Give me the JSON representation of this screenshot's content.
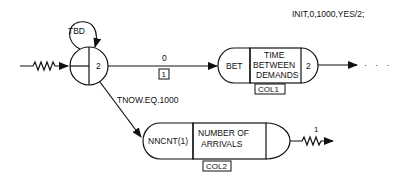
{
  "diagram": {
    "header_statement": "INIT,0,1000,YES/2;",
    "create_node": {
      "self_loop_label": "TBD",
      "max_branches": "2"
    },
    "activity_1": {
      "duration_label": "0",
      "activity_number": "1"
    },
    "activity_2": {
      "condition_label": "TNOW.EQ.1000"
    },
    "colct_node_1": {
      "attribute": "BET",
      "label_line1": "TIME",
      "label_line2": "BETWEEN",
      "label_line3": "DEMANDS",
      "max_branches": "2",
      "collect_id": "COL1"
    },
    "colct_node_2": {
      "attribute": "NNCNT(1)",
      "label_line1": "NUMBER OF",
      "label_line2": "ARRIVALS",
      "collect_id": "COL2"
    },
    "terminate": {
      "count": "1"
    },
    "continuation": "· · ·"
  }
}
